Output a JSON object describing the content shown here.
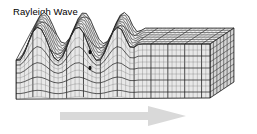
{
  "figure": {
    "title": "Rayleigh Wave",
    "type": "seismic-wave-diagram",
    "background_color": "#ffffff",
    "text_color": "#000000",
    "block": {
      "description": "3D rectangular block of ground shown in oblique projection, grid-meshed, deformed by a surface wave on the left and flat on the right",
      "mesh_line_color": "#1a1a1a",
      "mesh_light_line_color": "#777777",
      "face_fill_color": "#e8e8e8",
      "top_face_fill_color": "#f2f2f2",
      "side_face_fill_color": "#d5d5d5",
      "front_left_x": 16,
      "front_right_x": 210,
      "front_top_y": 44,
      "front_bottom_y": 98,
      "depth_dx": 24,
      "depth_dy": -16,
      "columns": 46,
      "rows": 9,
      "depth_rows": 7
    },
    "wave": {
      "description": "Retrograde elliptical surface motion producing three crests that decay toward the right",
      "crest_count": 3,
      "amplitude_px": 17,
      "wavelength_px": 40,
      "crest_x_positions": [
        38,
        78,
        118
      ],
      "decay_start_x": 122,
      "decay_end_x": 140
    },
    "motion_markers": {
      "description": "Small dark elliptical particle-motion markers inside the wave body",
      "color": "#111111",
      "positions": [
        {
          "x": 90,
          "y": 52
        },
        {
          "x": 90,
          "y": 68
        }
      ]
    },
    "propagation_arrow": {
      "label": "",
      "direction": "right",
      "color": "#d9d9d9",
      "shaft_left_x": 60,
      "shaft_right_x": 148,
      "shaft_top_y": 112,
      "shaft_bottom_y": 120,
      "head_tip_x": 186,
      "head_top_y": 106,
      "head_bottom_y": 126
    }
  }
}
